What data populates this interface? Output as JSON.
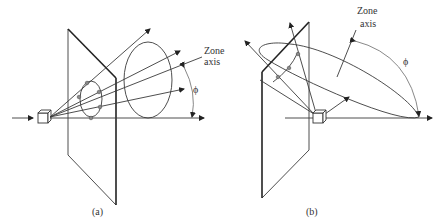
{
  "figure": {
    "panel_a": {
      "caption": "(a)",
      "zone_axis_label_line1": "Zone",
      "zone_axis_label_line2": "axis",
      "angle_symbol": "ϕ"
    },
    "panel_b": {
      "caption": "(b)",
      "zone_axis_label_line1": "Zone",
      "zone_axis_label_line2": "axis",
      "angle_symbol": "ϕ"
    }
  }
}
